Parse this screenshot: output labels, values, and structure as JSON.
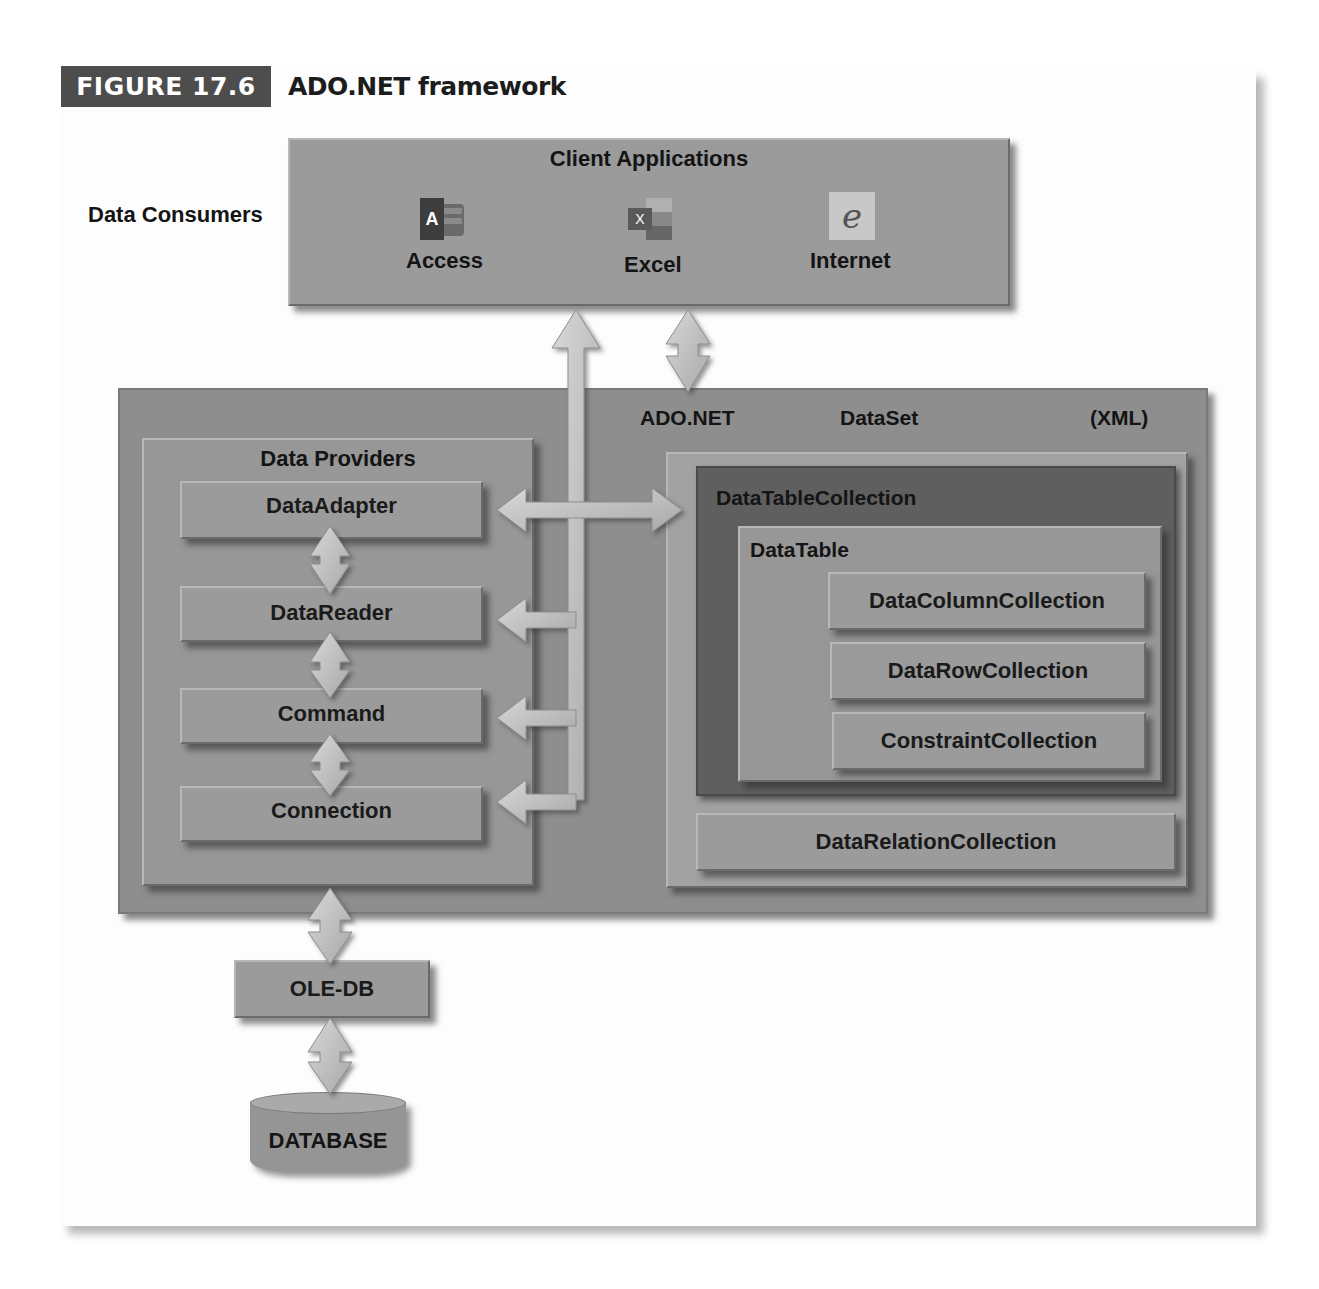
{
  "figure": {
    "number": "FIGURE 17.6",
    "title": "ADO.NET framework"
  },
  "consumers": {
    "label": "Data Consumers",
    "box_title": "Client Applications",
    "apps": [
      {
        "label": "Access",
        "icon": "access-icon",
        "glyph": "A"
      },
      {
        "label": "Excel",
        "icon": "excel-icon",
        "glyph": "X"
      },
      {
        "label": "Internet",
        "icon": "internet-explorer-icon",
        "glyph": "e"
      }
    ]
  },
  "adonet": {
    "label": "ADO.NET",
    "dataset_label": "DataSet",
    "xml_label": "(XML)"
  },
  "providers": {
    "title": "Data Providers",
    "items": [
      "DataAdapter",
      "DataReader",
      "Command",
      "Connection"
    ]
  },
  "dataset": {
    "table_collection": "DataTableCollection",
    "table": "DataTable",
    "table_items": [
      "DataColumnCollection",
      "DataRowCollection",
      "ConstraintCollection"
    ],
    "relation_collection": "DataRelationCollection"
  },
  "backend": {
    "oledb": "OLE-DB",
    "database": "DATABASE"
  },
  "colors": {
    "badge": "#4d4d4d",
    "panel": "#8e8e8e",
    "box": "#9b9b9b",
    "dark_panel": "#5e5e5e",
    "arrow": "#bdbdbd"
  }
}
